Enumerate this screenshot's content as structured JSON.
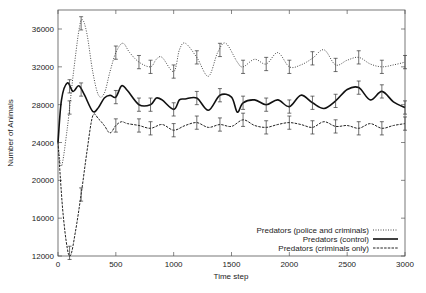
{
  "chart_data": {
    "type": "line",
    "title": "",
    "xlabel": "Time step",
    "ylabel": "Number of Animals",
    "xlim": [
      0,
      3000
    ],
    "ylim": [
      12000,
      38000
    ],
    "xticks": [
      0,
      500,
      1000,
      1500,
      2000,
      2500,
      3000
    ],
    "yticks": [
      12000,
      16000,
      20000,
      24000,
      28000,
      32000,
      36000
    ],
    "grid": false,
    "legend_position": "lower right",
    "series": [
      {
        "name": "Predators (police and criminals)",
        "style": "dotted",
        "x": [
          0,
          30,
          80,
          130,
          180,
          210,
          250,
          300,
          350,
          400,
          450,
          500,
          560,
          620,
          700,
          800,
          850,
          900,
          1000,
          1050,
          1100,
          1200,
          1300,
          1380,
          1450,
          1550,
          1600,
          1700,
          1800,
          1900,
          2000,
          2100,
          2200,
          2300,
          2400,
          2500,
          2600,
          2700,
          2800,
          2900,
          3000
        ],
        "values": [
          24000,
          21500,
          25500,
          31000,
          35800,
          37000,
          35500,
          31500,
          29000,
          29200,
          31500,
          33500,
          34500,
          33500,
          32500,
          32000,
          32800,
          33000,
          31500,
          33800,
          34500,
          33000,
          31000,
          33500,
          34500,
          32500,
          32000,
          32800,
          32300,
          33500,
          32000,
          32200,
          32900,
          33800,
          32200,
          32700,
          33000,
          32300,
          32000,
          32200,
          32500
        ]
      },
      {
        "name": "Predators (control)",
        "style": "solid",
        "x": [
          0,
          30,
          80,
          130,
          180,
          230,
          300,
          350,
          400,
          450,
          500,
          550,
          600,
          700,
          800,
          850,
          900,
          1000,
          1050,
          1100,
          1200,
          1300,
          1400,
          1500,
          1550,
          1600,
          1700,
          1800,
          1900,
          2000,
          2100,
          2200,
          2300,
          2400,
          2500,
          2600,
          2700,
          2800,
          2900,
          3000
        ],
        "values": [
          24000,
          28500,
          30300,
          29400,
          30000,
          29000,
          27300,
          27700,
          28700,
          29000,
          28800,
          30000,
          29500,
          28000,
          28000,
          28700,
          28500,
          27500,
          28500,
          28600,
          28700,
          27400,
          29000,
          28800,
          27200,
          28200,
          28500,
          28000,
          28500,
          27800,
          29000,
          28200,
          27600,
          28400,
          29600,
          29800,
          28500,
          29400,
          28300,
          27700
        ]
      },
      {
        "name": "Predators (criminals only)",
        "style": "dashed",
        "x": [
          0,
          40,
          80,
          110,
          150,
          200,
          250,
          300,
          350,
          400,
          450,
          500,
          550,
          600,
          700,
          800,
          900,
          1000,
          1100,
          1200,
          1300,
          1400,
          1500,
          1600,
          1700,
          1800,
          1900,
          2000,
          2100,
          2200,
          2300,
          2400,
          2500,
          2600,
          2700,
          2800,
          2900,
          3000
        ],
        "values": [
          24000,
          17000,
          12800,
          12100,
          14500,
          18500,
          23000,
          26800,
          26500,
          25800,
          25000,
          25800,
          26200,
          26000,
          25800,
          25500,
          25900,
          25300,
          25800,
          26100,
          25600,
          25900,
          25700,
          26400,
          25800,
          25600,
          25900,
          26100,
          25900,
          25600,
          26200,
          25700,
          25800,
          25500,
          26000,
          25500,
          25800,
          26000
        ]
      }
    ],
    "error_bar_times": [
      100,
      200,
      500,
      700,
      800,
      1000,
      1200,
      1400,
      1600,
      1800,
      2000,
      2200,
      2400,
      2600,
      2800,
      3000
    ],
    "error_bar_halfwidth": 700
  },
  "axes": {
    "xlabel": "Time step",
    "ylabel": "Number of Animals",
    "xtick_labels": [
      "0",
      "500",
      "1000",
      "1500",
      "2000",
      "2500",
      "3000"
    ],
    "ytick_labels": [
      "12000",
      "16000",
      "20000",
      "24000",
      "28000",
      "32000",
      "36000"
    ]
  },
  "legend": {
    "items": [
      {
        "label": "Predators (police and criminals)",
        "style": "dotted"
      },
      {
        "label": "Predators (control)",
        "style": "solid"
      },
      {
        "label": "Predators (criminals only)",
        "style": "dashed"
      }
    ]
  }
}
